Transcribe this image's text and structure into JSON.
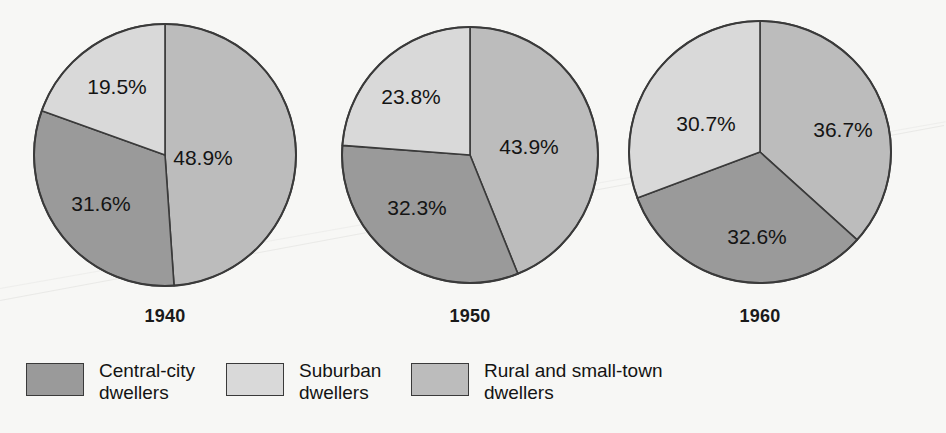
{
  "chart_data": {
    "type": "pie",
    "title": "",
    "subtitle": "",
    "xlabel": "",
    "ylabel": "",
    "grid": false,
    "legend_position": "bottom",
    "categories": [
      "Central-city dwellers",
      "Suburban dwellers",
      "Rural and small-town dwellers"
    ],
    "series": [
      {
        "name": "1940",
        "values": [
          31.6,
          19.5,
          48.9
        ],
        "labels": [
          "31.6%",
          "19.5%",
          "48.9%"
        ]
      },
      {
        "name": "1950",
        "values": [
          32.3,
          23.8,
          43.9
        ],
        "labels": [
          "32.3%",
          "23.8%",
          "43.9%"
        ]
      },
      {
        "name": "1960",
        "values": [
          32.6,
          30.7,
          36.7
        ],
        "labels": [
          "32.6%",
          "30.7%",
          "36.7%"
        ]
      }
    ],
    "slice_colors": [
      "#9a9a9a",
      "#d9d9d9",
      "#bcbcbc"
    ],
    "slice_order_clockwise_from_top": [
      "Rural and small-town dwellers",
      "Central-city dwellers",
      "Suburban dwellers"
    ],
    "background_color": "#f7f7f5",
    "outline_color": "#3a3a3a"
  },
  "pies": [
    {
      "year": "1940",
      "cx": 165,
      "cy": 155,
      "r": 131,
      "slices": [
        {
          "key": "rural",
          "label": "48.9%",
          "value": 48.9,
          "color": "#bcbcbc",
          "lx": 203,
          "ly": 157
        },
        {
          "key": "central",
          "label": "31.6%",
          "value": 31.6,
          "color": "#9a9a9a",
          "lx": 101,
          "ly": 203
        },
        {
          "key": "suburban",
          "label": "19.5%",
          "value": 19.5,
          "color": "#d9d9d9",
          "lx": 117,
          "ly": 86
        }
      ]
    },
    {
      "year": "1950",
      "cx": 470,
      "cy": 155,
      "r": 128,
      "slices": [
        {
          "key": "rural",
          "label": "43.9%",
          "value": 43.9,
          "color": "#bcbcbc",
          "lx": 529,
          "ly": 146
        },
        {
          "key": "central",
          "label": "32.3%",
          "value": 32.3,
          "color": "#9a9a9a",
          "lx": 417,
          "ly": 207
        },
        {
          "key": "suburban",
          "label": "23.8%",
          "value": 23.8,
          "color": "#d9d9d9",
          "lx": 411,
          "ly": 96
        }
      ]
    },
    {
      "year": "1960",
      "cx": 760,
      "cy": 152,
      "r": 131,
      "slices": [
        {
          "key": "rural",
          "label": "36.7%",
          "value": 36.7,
          "color": "#bcbcbc",
          "lx": 843,
          "ly": 129
        },
        {
          "key": "central",
          "label": "32.6%",
          "value": 32.6,
          "color": "#9a9a9a",
          "lx": 757,
          "ly": 236
        },
        {
          "key": "suburban",
          "label": "30.7%",
          "value": 30.7,
          "color": "#d9d9d9",
          "lx": 706,
          "ly": 123
        }
      ]
    }
  ],
  "legend": {
    "items": [
      {
        "label": "Central-city\ndwellers",
        "color": "#9a9a9a",
        "name": "central-city-dwellers"
      },
      {
        "label": "Suburban\ndwellers",
        "color": "#d9d9d9",
        "name": "suburban-dwellers"
      },
      {
        "label": "Rural and small-town\ndwellers",
        "color": "#bcbcbc",
        "name": "rural-and-small-town-dwellers"
      }
    ]
  }
}
